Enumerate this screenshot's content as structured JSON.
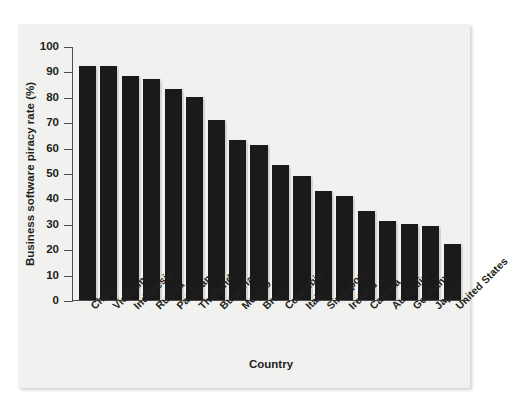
{
  "chart_data": {
    "type": "bar",
    "title": "",
    "xlabel": "Country",
    "ylabel": "Business software piracy rate (%)",
    "ylim": [
      0,
      100
    ],
    "yticks": [
      0,
      10,
      20,
      30,
      40,
      50,
      60,
      70,
      80,
      90,
      100
    ],
    "grid": false,
    "legend": null,
    "bar_color": "#1a1a1a",
    "categories": [
      "China",
      "Vietnam",
      "Indonesia",
      "Russia",
      "Pakistan",
      "Thailand",
      "Bulgaria",
      "Mexico",
      "Brazil",
      "Colombia",
      "Italy",
      "Singapore",
      "Ireland",
      "Canada",
      "Australia",
      "Germany",
      "Japan",
      "United States"
    ],
    "values": [
      92,
      92,
      88,
      87,
      83,
      80,
      71,
      63,
      61,
      53,
      49,
      43,
      41,
      35,
      31,
      30,
      29,
      22
    ]
  },
  "figure": {
    "page_background": "#f1f1ef",
    "axis_color": "#4d4d4d"
  }
}
